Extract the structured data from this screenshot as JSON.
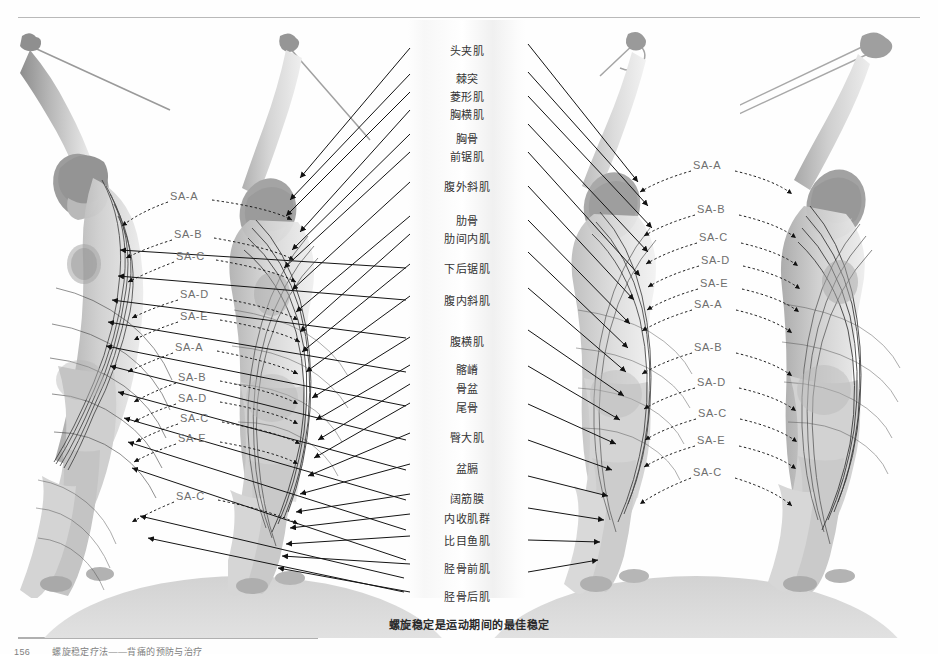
{
  "page": {
    "background": "#fefefe",
    "caption": "螺旋稳定是运动期间的最佳稳定",
    "footer": {
      "page_number": "156",
      "text": "螺旋稳定疗法——背痛的预防与治疗"
    }
  },
  "center_labels": [
    {
      "text": "头夹肌",
      "top": 22
    },
    {
      "text": "棘突",
      "top": 50
    },
    {
      "text": "菱形肌",
      "top": 68
    },
    {
      "text": "胸横肌",
      "top": 86
    },
    {
      "text": "胸骨",
      "top": 110
    },
    {
      "text": "前锯肌",
      "top": 128
    },
    {
      "text": "腹外斜肌",
      "top": 158
    },
    {
      "text": "肋骨",
      "top": 192
    },
    {
      "text": "肋间内肌",
      "top": 210
    },
    {
      "text": "下后锯肌",
      "top": 240
    },
    {
      "text": "腹内斜肌",
      "top": 272
    },
    {
      "text": "腹横肌",
      "top": 313
    },
    {
      "text": "髂嵴",
      "top": 341
    },
    {
      "text": "骨盆",
      "top": 360
    },
    {
      "text": "尾骨",
      "top": 379
    },
    {
      "text": "臀大肌",
      "top": 409
    },
    {
      "text": "盆膈",
      "top": 440
    },
    {
      "text": "阔筋膜",
      "top": 470
    },
    {
      "text": "内收肌群",
      "top": 490
    },
    {
      "text": "比目鱼肌",
      "top": 512
    },
    {
      "text": "胫骨前肌",
      "top": 540
    },
    {
      "text": "胫骨后肌",
      "top": 568
    }
  ],
  "sa_labels_left": [
    {
      "text": "SA-A",
      "left": 170,
      "top": 190
    },
    {
      "text": "SA-B",
      "left": 174,
      "top": 228
    },
    {
      "text": "SA-C",
      "left": 176,
      "top": 250
    },
    {
      "text": "SA-D",
      "left": 180,
      "top": 288
    },
    {
      "text": "SA-E",
      "left": 180,
      "top": 310
    },
    {
      "text": "SA-A",
      "left": 175,
      "top": 341
    },
    {
      "text": "SA-B",
      "left": 178,
      "top": 371
    },
    {
      "text": "SA-D",
      "left": 178,
      "top": 392
    },
    {
      "text": "SA-C",
      "left": 180,
      "top": 412
    },
    {
      "text": "SA-E",
      "left": 178,
      "top": 432
    },
    {
      "text": "SA-C",
      "left": 176,
      "top": 490
    }
  ],
  "sa_labels_right": [
    {
      "text": "SA-A",
      "left": 693,
      "top": 159
    },
    {
      "text": "SA-B",
      "left": 697,
      "top": 203
    },
    {
      "text": "SA-C",
      "left": 699,
      "top": 231
    },
    {
      "text": "SA-D",
      "left": 701,
      "top": 254
    },
    {
      "text": "SA-E",
      "left": 700,
      "top": 277
    },
    {
      "text": "SA-A",
      "left": 694,
      "top": 298
    },
    {
      "text": "SA-B",
      "left": 694,
      "top": 341
    },
    {
      "text": "SA-D",
      "left": 697,
      "top": 376
    },
    {
      "text": "SA-C",
      "left": 698,
      "top": 407
    },
    {
      "text": "SA-E",
      "left": 697,
      "top": 434
    },
    {
      "text": "SA-C",
      "left": 693,
      "top": 466
    }
  ],
  "figures": [
    {
      "name": "figure-left-side-bend",
      "left": 18,
      "top": 28,
      "width": 200,
      "height": 570
    },
    {
      "name": "figure-center-front-view",
      "left": 228,
      "top": 30,
      "width": 190,
      "height": 568
    },
    {
      "name": "figure-right-back-view",
      "left": 540,
      "top": 28,
      "width": 190,
      "height": 570
    },
    {
      "name": "figure-far-right-side",
      "left": 740,
      "top": 28,
      "width": 190,
      "height": 570
    }
  ],
  "colors": {
    "rule": "#b9b9b9",
    "label_text": "#333333",
    "sa_text": "#6e6e6e",
    "leader_line": "#1a1a1a",
    "ground_shadow": "#d2d2d2"
  }
}
